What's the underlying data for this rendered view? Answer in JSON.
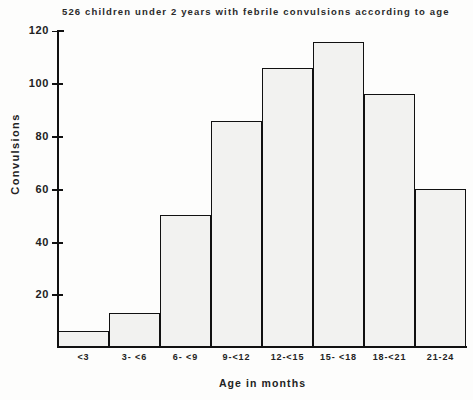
{
  "chart_data": {
    "type": "bar",
    "title": "526 children under 2 years with febrile convulsions according to age",
    "xlabel": "Age in months",
    "ylabel": "Convulsions",
    "categories": [
      "<3",
      "3- <6",
      "6- <9",
      "9-<12",
      "12-<15",
      "15- <18",
      "18-<21",
      "21-24"
    ],
    "values": [
      6,
      13,
      50,
      86,
      106,
      116,
      96,
      60
    ],
    "ylim": [
      0,
      120
    ],
    "yticks": [
      0,
      20,
      40,
      60,
      80,
      100,
      120
    ],
    "ytick_labels": [
      "",
      "20",
      "40",
      "60",
      "80",
      "100",
      "120"
    ],
    "grid": false,
    "legend": false,
    "series": [
      {
        "name": "Convulsions",
        "values": [
          6,
          13,
          50,
          86,
          106,
          116,
          96,
          60
        ]
      }
    ]
  },
  "axes": {
    "y_title": "Convulsions",
    "x_title": "Age in months",
    "y_labels": {
      "t120": "120",
      "t100": "100",
      "t80": "80",
      "t60": "60",
      "t40": "40",
      "t20": "20"
    }
  },
  "x_labels": {
    "b0": "<3",
    "b1": "3- <6",
    "b2": "6- <9",
    "b3": "9-<12",
    "b4": "12-<15",
    "b5": "15- <18",
    "b6": "18-<21",
    "b7": "21-24"
  },
  "colors": {
    "ink": "#111111",
    "bar_fill": "#f2f2f0",
    "bar_stipple": "#2b2b2b",
    "background": "#fdfdfc"
  }
}
